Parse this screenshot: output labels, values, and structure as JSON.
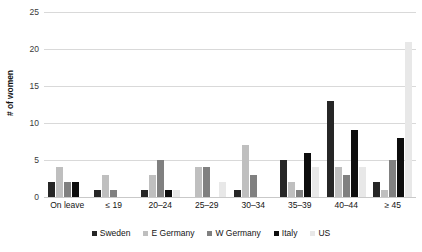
{
  "chart_data": {
    "type": "bar",
    "title": "",
    "subtitle": "",
    "xlabel": "",
    "ylabel": "# of women",
    "ylim": [
      0,
      25
    ],
    "yticks": [
      0,
      5,
      10,
      15,
      20,
      25
    ],
    "grid": true,
    "legend_position": "bottom",
    "categories": [
      "On leave",
      "≤ 19",
      "20–24",
      "25–29",
      "30–34",
      "35–39",
      "40–44",
      "≥ 45"
    ],
    "series": [
      {
        "name": "Sweden",
        "color": "#262626",
        "values": [
          2,
          1,
          1,
          0,
          1,
          5,
          13,
          2
        ]
      },
      {
        "name": "E Germany",
        "color": "#bfbfbf",
        "values": [
          4,
          3,
          3,
          4,
          7,
          2,
          4,
          1
        ]
      },
      {
        "name": "W Germany",
        "color": "#808080",
        "values": [
          2,
          1,
          5,
          4,
          3,
          1,
          3,
          5
        ]
      },
      {
        "name": "Italy",
        "color": "#0d0d0d",
        "values": [
          2,
          0,
          1,
          0,
          0,
          6,
          9,
          8
        ]
      },
      {
        "name": "US",
        "color": "#e8e8e8",
        "values": [
          0,
          0,
          1,
          2,
          0,
          4,
          4,
          21
        ]
      }
    ]
  },
  "axis": {
    "y_title": "# of women"
  }
}
